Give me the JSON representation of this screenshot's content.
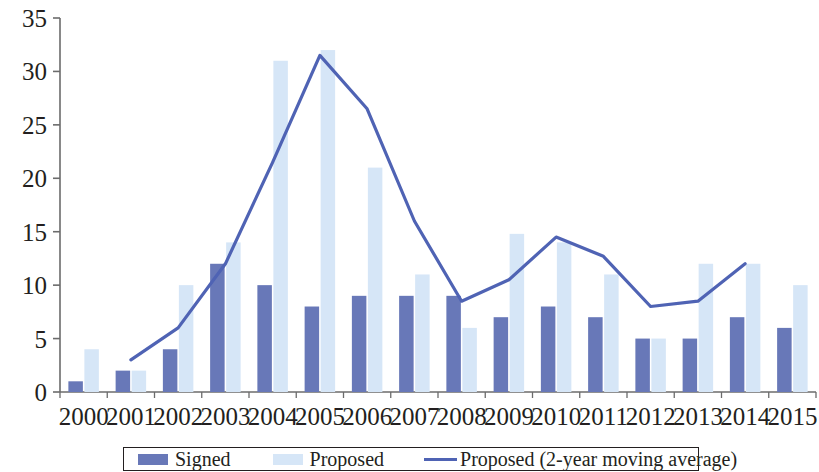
{
  "chart_data": {
    "type": "bar",
    "title": "",
    "subtitle": "",
    "xlabel": "",
    "ylabel": "",
    "ylim": [
      0,
      35
    ],
    "ytick_step": 5,
    "yticks": [
      "0",
      "5",
      "10",
      "15",
      "20",
      "25",
      "30",
      "35"
    ],
    "grid": false,
    "legend_position": "bottom",
    "categories": [
      "2000",
      "2001",
      "2002",
      "2003",
      "2004",
      "2005",
      "2006",
      "2007",
      "2008",
      "2009",
      "2010",
      "2011",
      "2012",
      "2013",
      "2014",
      "2015"
    ],
    "series": [
      {
        "name": "Signed",
        "type": "bar",
        "color": "#6878b8",
        "values": [
          1,
          2,
          4,
          12,
          10,
          8,
          9,
          9,
          9,
          7,
          8,
          7,
          5,
          5,
          7,
          6
        ]
      },
      {
        "name": "Proposed",
        "type": "bar",
        "color": "#d6e6f7",
        "values": [
          4,
          2,
          10,
          14,
          31,
          32,
          21,
          11,
          6,
          14.8,
          14,
          11,
          5,
          12,
          12,
          10
        ]
      },
      {
        "name": "Proposed (2-year moving average)",
        "type": "line",
        "color": "#4f63b4",
        "values": [
          null,
          3,
          6,
          12,
          21.5,
          31.5,
          26.5,
          16,
          8.5,
          10.5,
          14.5,
          12.7,
          8,
          8.5,
          12,
          null
        ]
      }
    ]
  },
  "legend": {
    "items": [
      {
        "label": "Signed",
        "marker": "bar-swatch-dark",
        "color": "#6878b8"
      },
      {
        "label": "Proposed",
        "marker": "bar-swatch-light",
        "color": "#d6e6f7"
      },
      {
        "label": "Proposed (2-year moving average)",
        "marker": "line-swatch",
        "color": "#4f63b4"
      }
    ]
  }
}
